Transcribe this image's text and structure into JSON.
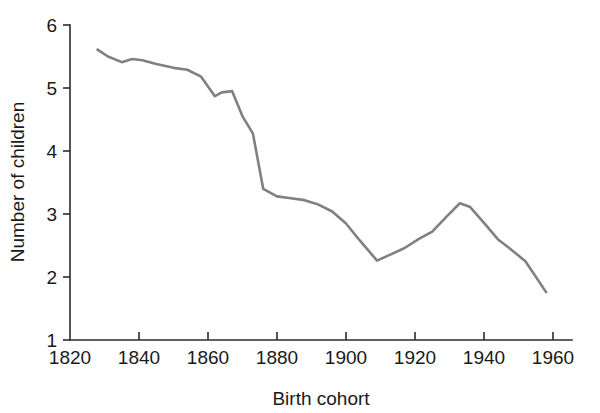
{
  "chart_data": {
    "type": "line",
    "title": "",
    "subtitle": "",
    "xlabel": "Birth cohort",
    "ylabel": "Number of children",
    "xlim": [
      1820,
      1965
    ],
    "ylim": [
      1,
      6
    ],
    "xticks": [
      1820,
      1840,
      1860,
      1880,
      1900,
      1920,
      1940,
      1960
    ],
    "xticklabels": [
      "1820",
      "1840",
      "1860",
      "1880",
      "1900",
      "1920",
      "1940",
      "1960"
    ],
    "yticks": [
      1,
      2,
      3,
      4,
      5,
      6
    ],
    "yticklabels": [
      "1",
      "2",
      "3",
      "4",
      "5",
      "6"
    ],
    "grid": false,
    "legend": null,
    "line_color": "#808080",
    "axis_color": "#2b2b2b",
    "series": [
      {
        "name": "Completed fertility",
        "color": "#808080",
        "x": [
          1828,
          1831,
          1835,
          1838,
          1841,
          1845,
          1850,
          1854,
          1858,
          1862,
          1864,
          1867,
          1870,
          1873,
          1876,
          1880,
          1884,
          1888,
          1892,
          1896,
          1900,
          1904,
          1909,
          1913,
          1917,
          1921,
          1925,
          1929,
          1933,
          1936,
          1940,
          1944,
          1948,
          1952,
          1958
        ],
        "y": [
          5.61,
          5.5,
          5.41,
          5.46,
          5.44,
          5.38,
          5.32,
          5.29,
          5.18,
          4.87,
          4.93,
          4.95,
          4.55,
          4.28,
          3.4,
          3.28,
          3.25,
          3.22,
          3.15,
          3.04,
          2.85,
          2.58,
          2.26,
          2.36,
          2.46,
          2.6,
          2.72,
          2.95,
          3.17,
          3.11,
          2.86,
          2.6,
          2.43,
          2.25,
          1.76
        ]
      }
    ]
  },
  "axis_labels": {
    "x_title": "Birth cohort",
    "y_title": "Number of children"
  }
}
